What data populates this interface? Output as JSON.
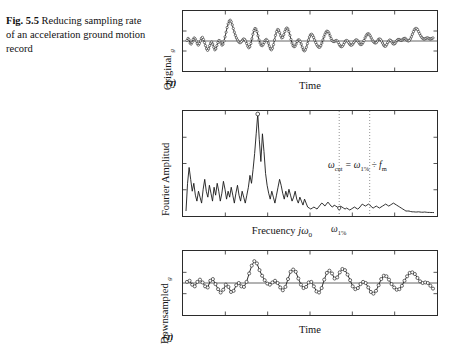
{
  "caption": {
    "label": "Fig. 5.5",
    "text": "Reducing sampling rate of an acceleration ground motion record"
  },
  "figure": {
    "panels": [
      {
        "id": "original-record",
        "ylabel": "Original üg(t)",
        "xlabel": "Time",
        "marker": "circle",
        "zero_line": true
      },
      {
        "id": "fourier-spectrum",
        "ylabel": "Fourier Amplitud",
        "xlabel": "Frecuency jω0",
        "marker": "peak-circle",
        "zero_line": false,
        "cut_label": "ω1%",
        "annotation": "ωcut = ω1% ÷ fm"
      },
      {
        "id": "downsampled-record",
        "ylabel": "Downsampled üg(t)",
        "xlabel": "Time",
        "marker": "circle",
        "zero_line": true
      }
    ]
  },
  "colors": {
    "line": "#1a1a1a",
    "frame": "#2b2b2b",
    "zero": "#555555",
    "dotted": "#777777",
    "background": "#ffffff"
  },
  "chart_data": [
    {
      "type": "line",
      "id": "original-record",
      "title": "Original acceleration ground motion record",
      "xlabel": "Time",
      "ylabel": "Original üg(t)",
      "xlim": [
        0,
        1
      ],
      "ylim": [
        -1,
        1
      ],
      "grid": false,
      "markers": "open circles at every sample",
      "n_samples": 240,
      "y": [
        0.02,
        0.1,
        0.05,
        -0.08,
        -0.12,
        -0.05,
        0.06,
        0.12,
        0.08,
        0.0,
        -0.1,
        -0.16,
        -0.1,
        0.0,
        0.1,
        0.14,
        0.06,
        -0.06,
        -0.18,
        -0.3,
        -0.36,
        -0.3,
        -0.18,
        -0.08,
        -0.04,
        -0.12,
        -0.24,
        -0.34,
        -0.3,
        -0.18,
        -0.06,
        0.02,
        0.0,
        -0.08,
        -0.16,
        -0.12,
        0.0,
        0.16,
        0.34,
        0.52,
        0.66,
        0.76,
        0.8,
        0.74,
        0.62,
        0.48,
        0.34,
        0.22,
        0.12,
        0.04,
        -0.02,
        -0.06,
        -0.06,
        -0.02,
        0.04,
        0.08,
        0.06,
        0.0,
        -0.1,
        -0.2,
        -0.26,
        -0.22,
        -0.1,
        0.08,
        0.26,
        0.4,
        0.48,
        0.46,
        0.36,
        0.2,
        0.04,
        -0.08,
        -0.16,
        -0.18,
        -0.14,
        -0.06,
        0.02,
        0.06,
        0.02,
        -0.08,
        -0.2,
        -0.3,
        -0.34,
        -0.28,
        -0.14,
        0.04,
        0.22,
        0.36,
        0.44,
        0.42,
        0.32,
        0.2,
        0.12,
        0.14,
        0.24,
        0.36,
        0.46,
        0.5,
        0.46,
        0.36,
        0.22,
        0.06,
        -0.08,
        -0.18,
        -0.22,
        -0.2,
        -0.12,
        -0.02,
        0.04,
        0.04,
        -0.02,
        -0.12,
        -0.24,
        -0.34,
        -0.38,
        -0.34,
        -0.24,
        -0.1,
        0.04,
        0.16,
        0.24,
        0.26,
        0.22,
        0.14,
        0.04,
        -0.06,
        -0.14,
        -0.2,
        -0.24,
        -0.24,
        -0.18,
        -0.08,
        0.04,
        0.16,
        0.26,
        0.34,
        0.38,
        0.36,
        0.3,
        0.2,
        0.1,
        0.02,
        -0.02,
        -0.02,
        0.0,
        0.02,
        0.0,
        -0.06,
        -0.14,
        -0.2,
        -0.22,
        -0.2,
        -0.14,
        -0.06,
        0.0,
        0.02,
        0.0,
        -0.06,
        -0.12,
        -0.16,
        -0.16,
        -0.12,
        -0.06,
        0.0,
        0.04,
        0.04,
        0.0,
        -0.06,
        -0.12,
        -0.14,
        -0.12,
        -0.06,
        0.02,
        0.12,
        0.2,
        0.26,
        0.28,
        0.26,
        0.2,
        0.12,
        0.04,
        -0.02,
        -0.06,
        -0.08,
        -0.06,
        0.0,
        0.06,
        0.08,
        0.06,
        0.0,
        -0.08,
        -0.16,
        -0.2,
        -0.2,
        -0.14,
        -0.06,
        0.0,
        0.04,
        0.02,
        -0.04,
        -0.1,
        -0.12,
        -0.1,
        -0.04,
        0.02,
        0.06,
        0.06,
        0.04,
        0.02,
        0.04,
        0.08,
        0.1,
        0.1,
        0.06,
        0.02,
        0.0,
        0.02,
        0.08,
        0.16,
        0.26,
        0.36,
        0.44,
        0.48,
        0.48,
        0.44,
        0.36,
        0.28,
        0.2,
        0.14,
        0.1,
        0.08,
        0.08,
        0.1,
        0.12,
        0.12,
        0.1,
        0.08,
        0.08,
        0.1,
        0.12
      ]
    },
    {
      "type": "line",
      "id": "fourier-spectrum",
      "title": "Fourier amplitude spectrum with cut-off frequencies",
      "xlabel": "Frecuency jω0",
      "ylabel": "Fourier Amplitud",
      "xlim": [
        0,
        1
      ],
      "ylim": [
        0,
        1
      ],
      "grid": false,
      "peak_marker_index": 46,
      "cut_markers": [
        {
          "name": "ω1%",
          "x_frac": 0.615,
          "style": "dotted-vertical",
          "labeled_on_axis": true
        },
        {
          "name": "ωcut",
          "x_frac": 0.735,
          "style": "dotted-vertical",
          "labeled_on_axis": false
        }
      ],
      "annotation": "ωcut = ω1% ÷ fm",
      "n_samples": 160,
      "y": [
        0.02,
        0.3,
        0.46,
        0.34,
        0.22,
        0.3,
        0.18,
        0.12,
        0.22,
        0.16,
        0.1,
        0.24,
        0.34,
        0.22,
        0.16,
        0.28,
        0.2,
        0.12,
        0.26,
        0.18,
        0.3,
        0.22,
        0.12,
        0.2,
        0.32,
        0.24,
        0.14,
        0.22,
        0.16,
        0.26,
        0.18,
        0.1,
        0.2,
        0.28,
        0.18,
        0.12,
        0.22,
        0.16,
        0.1,
        0.18,
        0.26,
        0.38,
        0.3,
        0.44,
        0.6,
        0.8,
        1.0,
        0.74,
        0.52,
        0.8,
        0.62,
        0.4,
        0.28,
        0.2,
        0.14,
        0.22,
        0.16,
        0.1,
        0.18,
        0.26,
        0.34,
        0.28,
        0.2,
        0.14,
        0.22,
        0.16,
        0.24,
        0.18,
        0.12,
        0.16,
        0.22,
        0.14,
        0.1,
        0.16,
        0.12,
        0.08,
        0.14,
        0.1,
        0.06,
        0.05,
        0.04,
        0.05,
        0.06,
        0.05,
        0.04,
        0.06,
        0.08,
        0.1,
        0.09,
        0.07,
        0.09,
        0.11,
        0.09,
        0.07,
        0.06,
        0.08,
        0.07,
        0.06,
        0.05,
        0.07,
        0.06,
        0.05,
        0.04,
        0.05,
        0.04,
        0.03,
        0.04,
        0.05,
        0.06,
        0.05,
        0.04,
        0.05,
        0.07,
        0.09,
        0.08,
        0.07,
        0.08,
        0.09,
        0.08,
        0.06,
        0.05,
        0.06,
        0.07,
        0.06,
        0.05,
        0.06,
        0.07,
        0.08,
        0.09,
        0.08,
        0.07,
        0.08,
        0.09,
        0.1,
        0.09,
        0.08,
        0.07,
        0.06,
        0.05,
        0.04,
        0.03,
        0.02,
        0.02,
        0.02,
        0.015,
        0.012,
        0.012,
        0.01,
        0.01,
        0.012,
        0.01,
        0.008,
        0.008,
        0.01,
        0.008,
        0.006,
        0.006,
        0.005,
        0.005,
        0.004
      ]
    },
    {
      "type": "line",
      "id": "downsampled-record",
      "title": "Downsampled acceleration ground motion record",
      "xlabel": "Time",
      "ylabel": "Downsampled üg(t)",
      "xlim": [
        0,
        1
      ],
      "ylim": [
        -1,
        1
      ],
      "grid": false,
      "markers": "open circles at every sample (coarser sampling)",
      "n_samples": 96,
      "y": [
        0.04,
        0.08,
        -0.06,
        -0.12,
        0.04,
        0.12,
        0.02,
        -0.12,
        -0.16,
        0.08,
        0.14,
        -0.04,
        -0.22,
        -0.34,
        -0.24,
        -0.06,
        -0.14,
        -0.32,
        -0.28,
        -0.08,
        0.0,
        -0.12,
        -0.14,
        0.04,
        0.34,
        0.62,
        0.78,
        0.7,
        0.46,
        0.26,
        0.1,
        -0.02,
        -0.06,
        0.02,
        0.08,
        0.0,
        -0.16,
        -0.26,
        -0.14,
        0.14,
        0.4,
        0.48,
        0.4,
        0.16,
        -0.06,
        -0.18,
        -0.14,
        0.02,
        0.04,
        -0.12,
        -0.3,
        -0.34,
        -0.18,
        0.12,
        0.36,
        0.44,
        0.34,
        0.16,
        0.2,
        0.38,
        0.5,
        0.46,
        0.3,
        0.1,
        -0.12,
        -0.22,
        -0.18,
        -0.04,
        0.04,
        0.0,
        -0.16,
        -0.32,
        -0.38,
        -0.28,
        -0.08,
        0.14,
        0.26,
        0.24,
        0.12,
        -0.04,
        -0.16,
        -0.24,
        -0.22,
        -0.1,
        0.08,
        0.24,
        0.36,
        0.38,
        0.32,
        0.18,
        0.06,
        0.0,
        0.02,
        0.0,
        -0.1,
        -0.2
      ]
    }
  ]
}
